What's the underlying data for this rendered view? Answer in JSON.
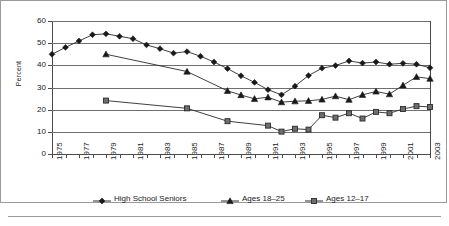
{
  "figure": {
    "ylabel": "Percent"
  },
  "chart_data": {
    "type": "line",
    "title": "",
    "xlabel": "",
    "ylabel": "Percent",
    "ylim": [
      0,
      60
    ],
    "ytick_values": [
      0,
      10,
      20,
      30,
      40,
      50,
      60
    ],
    "ytick_labels": [
      "0",
      "10",
      "20",
      "30",
      "40",
      "50",
      "60"
    ],
    "grid": true,
    "xlim": [
      1975,
      2003
    ],
    "x": [
      1975,
      1976,
      1977,
      1978,
      1979,
      1980,
      1981,
      1982,
      1983,
      1984,
      1985,
      1986,
      1987,
      1988,
      1989,
      1990,
      1991,
      1992,
      1993,
      1994,
      1995,
      1996,
      1997,
      1998,
      1999,
      2000,
      2001,
      2002,
      2003
    ],
    "xtick_labels": [
      "1975",
      "1977",
      "1979",
      "1981",
      "1983",
      "1985",
      "1987",
      "1989",
      "1991",
      "1993",
      "1995",
      "1997",
      "1999",
      "2001",
      "2003"
    ],
    "xtick_label_years": [
      1975,
      1977,
      1979,
      1981,
      1983,
      1985,
      1987,
      1989,
      1991,
      1993,
      1995,
      1997,
      1999,
      2001,
      2003
    ],
    "legend_position": "bottom",
    "series": [
      {
        "name": "High School Seniors",
        "marker": "diamond",
        "color": "#1a1a1a",
        "x": [
          1975,
          1976,
          1977,
          1978,
          1979,
          1980,
          1981,
          1982,
          1983,
          1984,
          1985,
          1986,
          1987,
          1988,
          1989,
          1990,
          1991,
          1992,
          1993,
          1994,
          1995,
          1996,
          1997,
          1998,
          1999,
          2000,
          2001,
          2002,
          2003
        ],
        "values": [
          45.0,
          48.1,
          51.0,
          53.8,
          54.2,
          53.1,
          52.0,
          49.2,
          47.5,
          45.5,
          46.2,
          44.1,
          41.5,
          38.5,
          35.3,
          32.3,
          29.0,
          26.7,
          30.6,
          35.4,
          38.7,
          39.9,
          42.0,
          41.0,
          41.5,
          40.5,
          40.9,
          40.5,
          38.9
        ]
      },
      {
        "name": "Ages 18–25",
        "marker": "triangle",
        "color": "#1a1a1a",
        "x": [
          1979,
          1985,
          1988,
          1989,
          1990,
          1991,
          1992,
          1993,
          1994,
          1995,
          1996,
          1997,
          1998,
          1999,
          2000,
          2001,
          2002,
          2003
        ],
        "values": [
          45.0,
          37.2,
          28.5,
          26.6,
          24.9,
          25.6,
          23.4,
          23.8,
          24.0,
          24.6,
          26.1,
          24.5,
          26.7,
          28.2,
          27.0,
          31.0,
          34.8,
          34.0
        ]
      },
      {
        "name": "Ages 12–17",
        "marker": "square",
        "color": "#6e6e6e",
        "x": [
          1979,
          1985,
          1988,
          1991,
          1992,
          1993,
          1994,
          1995,
          1996,
          1997,
          1998,
          1999,
          2000,
          2001,
          2002,
          2003
        ],
        "values": [
          24.1,
          20.6,
          14.8,
          12.8,
          10.1,
          11.4,
          11.0,
          17.5,
          16.4,
          18.4,
          16.0,
          19.0,
          18.4,
          20.3,
          21.6,
          21.2
        ]
      }
    ]
  },
  "legend": {
    "entries": [
      {
        "label": "High School Seniors",
        "marker": "diamond"
      },
      {
        "label": "Ages 18–25",
        "marker": "triangle"
      },
      {
        "label": "Ages 12–17",
        "marker": "square"
      }
    ]
  }
}
